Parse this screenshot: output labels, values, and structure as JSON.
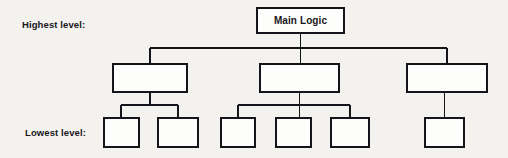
{
  "diagram": {
    "background_color": "#f4f2ef",
    "line_color": "#14141a",
    "node_fill": "#fdfdfb",
    "labels": {
      "highest_level": "Highest level:",
      "lowest_level": "Lowest level:"
    },
    "levels": [
      {
        "name": "highest",
        "row_label": "Highest level:",
        "nodes": [
          {
            "id": "main-logic",
            "text": "Main Logic",
            "x": 256,
            "y": 7,
            "w": 89,
            "h": 27
          }
        ]
      },
      {
        "name": "middle",
        "row_label": "",
        "nodes": [
          {
            "id": "mid-1",
            "text": "",
            "x": 112,
            "y": 63,
            "w": 76,
            "h": 30
          },
          {
            "id": "mid-2",
            "text": "",
            "x": 259,
            "y": 63,
            "w": 81,
            "h": 30
          },
          {
            "id": "mid-3",
            "text": "",
            "x": 406,
            "y": 63,
            "w": 82,
            "h": 30
          }
        ]
      },
      {
        "name": "lowest",
        "row_label": "Lowest level:",
        "nodes": [
          {
            "id": "leaf-1",
            "text": "",
            "x": 103,
            "y": 117,
            "w": 37,
            "h": 31
          },
          {
            "id": "leaf-2",
            "text": "",
            "x": 157,
            "y": 117,
            "w": 42,
            "h": 31
          },
          {
            "id": "leaf-3",
            "text": "",
            "x": 220,
            "y": 117,
            "w": 36,
            "h": 31
          },
          {
            "id": "leaf-4",
            "text": "",
            "x": 275,
            "y": 117,
            "w": 37,
            "h": 31
          },
          {
            "id": "leaf-5",
            "text": "",
            "x": 330,
            "y": 117,
            "w": 40,
            "h": 31
          },
          {
            "id": "leaf-6",
            "text": "",
            "x": 424,
            "y": 117,
            "w": 41,
            "h": 31
          }
        ]
      }
    ],
    "connectors": {
      "root_drop": {
        "x": 300.5,
        "y1": 34,
        "y2": 63
      },
      "main_bus": {
        "y": 48,
        "x1": 150,
        "x2": 447
      },
      "bus_drops": [
        {
          "x": 150,
          "y1": 48,
          "y2": 63
        },
        {
          "x": 447,
          "y1": 48,
          "y2": 63
        }
      ],
      "group_buses": [
        {
          "id": "bus-left",
          "y": 105,
          "x1": 121,
          "x2": 178,
          "parent_x": 150,
          "parent_y": 93
        },
        {
          "id": "bus-mid",
          "y": 105,
          "x1": 238,
          "x2": 350,
          "parent_x": 299.5,
          "parent_y": 93
        }
      ],
      "leaf_drops": [
        {
          "x": 121,
          "y1": 105,
          "y2": 117
        },
        {
          "x": 178,
          "y1": 105,
          "y2": 117
        },
        {
          "x": 238,
          "y1": 105,
          "y2": 117
        },
        {
          "x": 293.5,
          "y1": 105,
          "y2": 117
        },
        {
          "x": 350,
          "y1": 105,
          "y2": 117
        },
        {
          "x": 444.5,
          "y1": 93,
          "y2": 117
        }
      ]
    },
    "label_positions": {
      "highest_level": {
        "x": 22,
        "y": 20
      },
      "lowest_level": {
        "x": 25,
        "y": 128
      }
    }
  }
}
